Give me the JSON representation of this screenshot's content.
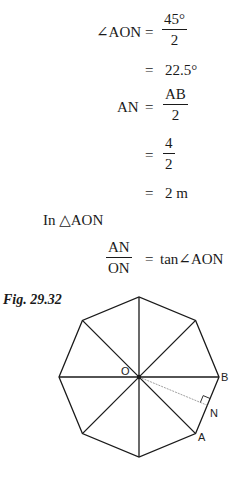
{
  "equations": {
    "line1": {
      "lhs": "∠AON",
      "eq": "=",
      "num": "45°",
      "den": "2"
    },
    "line2": {
      "eq": "=",
      "rhs": "22.5°"
    },
    "line3": {
      "lhs": "AN",
      "eq": "=",
      "num": "AB",
      "den": "2"
    },
    "line4": {
      "eq": "=",
      "num": "4",
      "den": "2"
    },
    "line5": {
      "eq": "=",
      "rhs": "2 m"
    },
    "statement": "In △AON",
    "line6": {
      "num": "AN",
      "den": "ON",
      "eq": "=",
      "rhs": "tan∠AON"
    }
  },
  "figure": {
    "caption": "Fig. 29.32",
    "shape": "regular octagon",
    "labels": {
      "center": "O",
      "vertex_b": "B",
      "vertex_a": "A",
      "foot": "N"
    },
    "stroke_color": "#1a1a1a"
  }
}
